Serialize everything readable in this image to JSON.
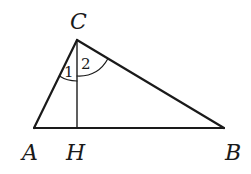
{
  "diagram": {
    "type": "triangle-with-altitude",
    "stroke_color": "#1a1a1a",
    "background": "#ffffff",
    "points": {
      "A": {
        "label": "A",
        "x": 34,
        "y": 128
      },
      "B": {
        "label": "B",
        "x": 224,
        "y": 128
      },
      "C": {
        "label": "C",
        "x": 77,
        "y": 40
      },
      "H": {
        "label": "H",
        "x": 77,
        "y": 128
      }
    },
    "segments": [
      "AB",
      "BC",
      "CA",
      "CH"
    ],
    "angles": [
      {
        "label": "1",
        "vertex": "C",
        "between": [
          "CA",
          "CH"
        ]
      },
      {
        "label": "2",
        "vertex": "C",
        "between": [
          "CH",
          "CB"
        ]
      }
    ]
  }
}
